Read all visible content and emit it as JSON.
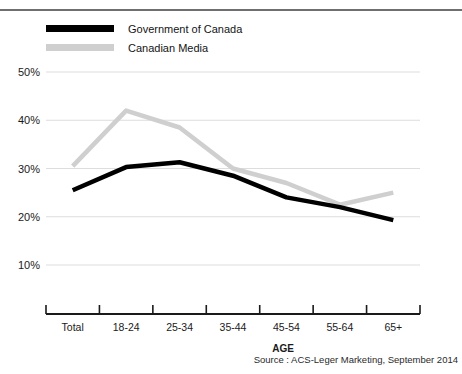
{
  "header": {
    "cropped_text": ""
  },
  "legend": {
    "position": "top-left",
    "items": [
      {
        "label": "Government of Canada",
        "color": "#000000",
        "name": "legend-government-of-canada"
      },
      {
        "label": "Canadian Media",
        "color": "#cfcfcf",
        "name": "legend-canadian-media"
      }
    ]
  },
  "axis": {
    "x_title": "AGE",
    "y_ticks": [
      "10%",
      "20%",
      "30%",
      "40%",
      "50%"
    ],
    "x_ticks": [
      "Total",
      "18-24",
      "25-34",
      "35-44",
      "45-54",
      "55-64",
      "65+"
    ]
  },
  "source": "Source : ACS-Leger Marketing, September 2014",
  "chart_data": {
    "type": "line",
    "title": "",
    "subtitle": "",
    "xlabel": "AGE",
    "ylabel": "",
    "categories": [
      "Total",
      "18-24",
      "25-34",
      "35-44",
      "45-54",
      "55-64",
      "65+"
    ],
    "ylim": [
      5,
      50
    ],
    "ytick_values": [
      10,
      20,
      30,
      40,
      50
    ],
    "ytick_labels": [
      "10%",
      "20%",
      "30%",
      "40%",
      "50%"
    ],
    "grid": "horizontal",
    "legend_position": "top-left",
    "series": [
      {
        "name": "Government of Canada",
        "color": "#000000",
        "values": [
          25.5,
          30.3,
          31.3,
          28.5,
          24.0,
          22.0,
          19.3
        ]
      },
      {
        "name": "Canadian Media",
        "color": "#cfcfcf",
        "values": [
          30.5,
          42.0,
          38.5,
          30.0,
          27.0,
          22.5,
          25.0
        ]
      }
    ],
    "annotations": [
      "Source : ACS-Leger Marketing, September 2014"
    ]
  }
}
